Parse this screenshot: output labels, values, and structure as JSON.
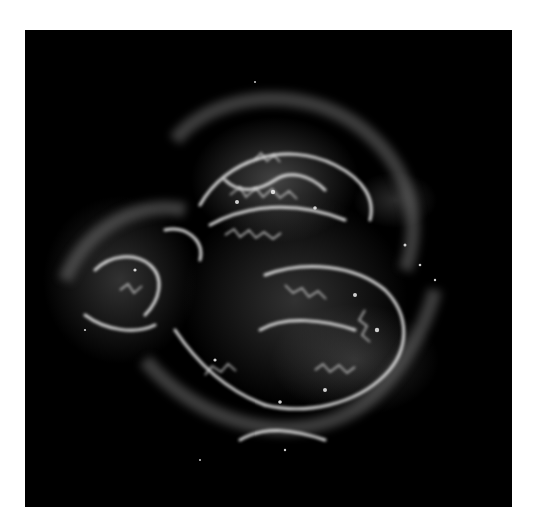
{
  "image": {
    "subject": "supernova remnant",
    "description": "Grayscale astronomical image of a roughly circular supernova remnant with bright filamentary shell on black background",
    "colors": {
      "background_page": "#ffffff",
      "sky": "#000000",
      "filament_bright": "#f4f4f4",
      "nebula_mid": "#6a6a6a",
      "nebula_dim": "#2a2a2a"
    }
  }
}
